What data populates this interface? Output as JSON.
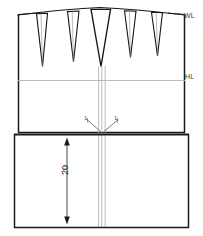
{
  "diagram": {
    "background_color": "#ffffff",
    "line_color": "#1a1a1a",
    "guide_color": "#b0b0b0",
    "center_line_color": "#9a9a9a",
    "labels": {
      "waist_line": "WL",
      "hip_line": "HL",
      "notch_left": "1",
      "notch_right": "1",
      "dimension": "20"
    },
    "levels": [
      {
        "name": "waist-line",
        "code": "WL",
        "y": 14
      },
      {
        "name": "hip-line",
        "code": "HL",
        "y": 80
      }
    ],
    "darts": [
      {
        "name": "dart-1",
        "apex_x": 42,
        "top_x": 36,
        "width": 11,
        "depth": 53
      },
      {
        "name": "dart-2",
        "apex_x": 73,
        "top_x": 68,
        "width": 12,
        "depth": 50
      },
      {
        "name": "dart-3",
        "apex_x": 100,
        "top_x": 94,
        "width": 20,
        "depth": 58
      },
      {
        "name": "dart-4",
        "apex_x": 130,
        "top_x": 125,
        "width": 12,
        "depth": 46
      },
      {
        "name": "dart-5",
        "apex_x": 157,
        "top_x": 152,
        "width": 11,
        "depth": 44
      }
    ],
    "dimension": {
      "label": "20",
      "value": 20,
      "x": 67,
      "from_y": 140,
      "to_y": 222,
      "orientation": "vertical"
    },
    "blocks": [
      {
        "name": "upper-block",
        "left": 18,
        "right": 185,
        "top": 12,
        "bottom": 132
      },
      {
        "name": "lower-block",
        "left": 14,
        "right": 189,
        "top": 134,
        "bottom": 228
      }
    ]
  }
}
